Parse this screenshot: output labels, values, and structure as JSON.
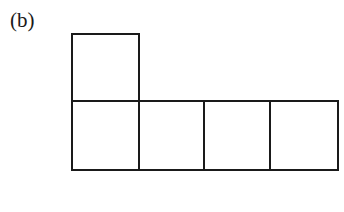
{
  "figure": {
    "label": "(b)",
    "line_color": "#1a1a1a",
    "squares": [
      {
        "x": 72,
        "y": 34,
        "w": 67,
        "h": 67,
        "position": "top"
      },
      {
        "x": 72,
        "y": 101,
        "w": 67,
        "h": 69,
        "position": "row-1"
      },
      {
        "x": 139,
        "y": 101,
        "w": 65,
        "h": 69,
        "position": "row-2"
      },
      {
        "x": 204,
        "y": 101,
        "w": 66,
        "h": 69,
        "position": "row-3"
      },
      {
        "x": 270,
        "y": 101,
        "w": 68,
        "h": 69,
        "position": "row-4"
      }
    ]
  }
}
